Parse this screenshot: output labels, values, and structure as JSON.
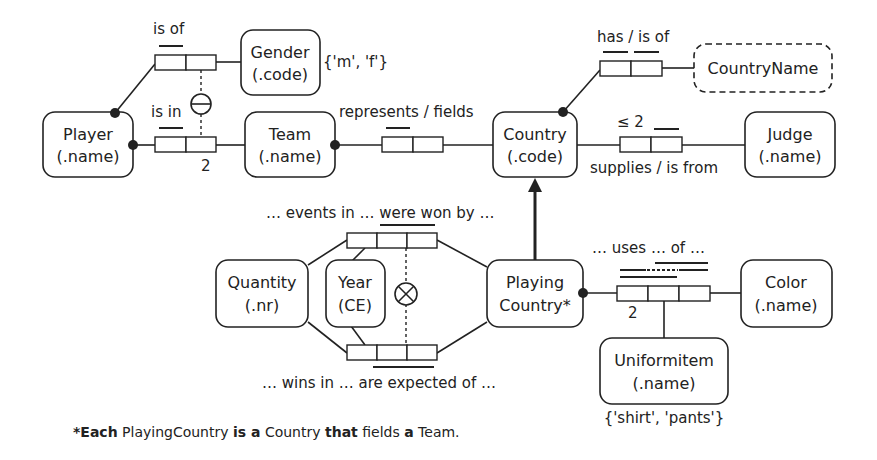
{
  "diagram": {
    "type": "ORM schema",
    "entities": {
      "player": {
        "name": "Player",
        "ref": "(.name)"
      },
      "gender": {
        "name": "Gender",
        "ref": "(.code)",
        "values": "{'m', 'f'}"
      },
      "team": {
        "name": "Team",
        "ref": "(.name)"
      },
      "country": {
        "name": "Country",
        "ref": "(.code)"
      },
      "country_name": {
        "name": "CountryName"
      },
      "judge": {
        "name": "Judge",
        "ref": "(.name)"
      },
      "quantity": {
        "name": "Quantity",
        "ref": "(.nr)"
      },
      "year": {
        "name": "Year",
        "ref": "(CE)"
      },
      "playing_country": {
        "name": "Playing",
        "name2": "Country*"
      },
      "color": {
        "name": "Color",
        "ref": "(.name)"
      },
      "uniform_item": {
        "name": "Uniformitem",
        "ref": "(.name)",
        "values": "{'shirt', 'pants'}"
      }
    },
    "fact_types": {
      "is_of": {
        "reading": "is of"
      },
      "is_in": {
        "reading": "is in",
        "frequency": "2"
      },
      "represents": {
        "reading": "represents / fields"
      },
      "has": {
        "reading": "has / is of"
      },
      "supplies": {
        "reading": "supplies / is from",
        "frequency": "≤ 2"
      },
      "won_by": {
        "reading": "… events in … were won by …"
      },
      "expected_of": {
        "reading": "… wins in … are expected of …"
      },
      "uses": {
        "reading": "… uses … of …",
        "frequency": "2"
      }
    },
    "footnote": {
      "star": "*",
      "each": "Each",
      "t1": " PlayingCountry ",
      "is_a": "is a",
      "t2": " Country ",
      "that": "that",
      "t3": " fields ",
      "a": "a",
      "t4": " Team."
    }
  }
}
